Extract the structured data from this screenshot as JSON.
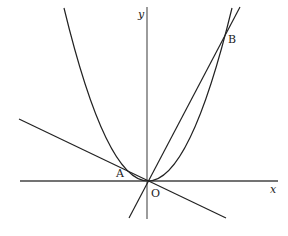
{
  "figure": {
    "type": "coordinate-diagram",
    "axes": {
      "x_label": "x",
      "y_label": "y",
      "origin_label": "O"
    },
    "points": [
      {
        "name": "A",
        "label": "A"
      },
      {
        "name": "B",
        "label": "B"
      },
      {
        "name": "O",
        "label": "O"
      }
    ],
    "curves": [
      {
        "name": "parabola",
        "kind": "parabola"
      },
      {
        "name": "line-OB",
        "kind": "line"
      },
      {
        "name": "line-AO",
        "kind": "line"
      }
    ],
    "colors": {
      "stroke": "#222222",
      "axis": "#555555",
      "background": "#ffffff"
    }
  }
}
